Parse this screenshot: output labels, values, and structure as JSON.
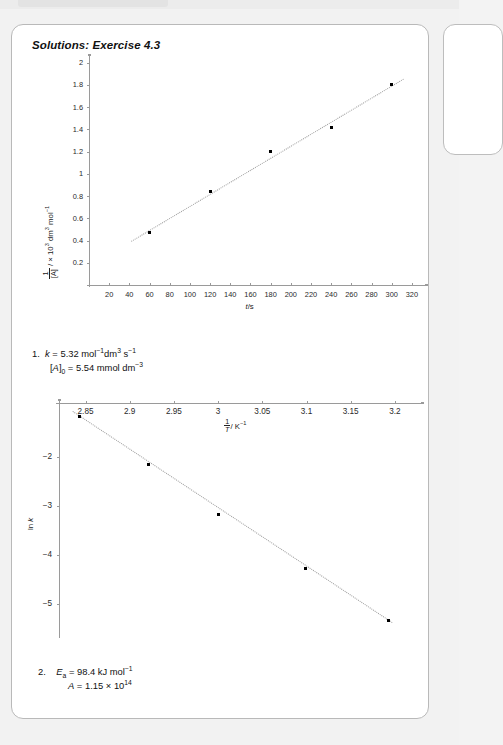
{
  "document": {
    "title": "Solutions: Exercise 4.3"
  },
  "chart_data": [
    {
      "type": "scatter",
      "id": "second-order-plot",
      "title": "",
      "xlabel": "t/s",
      "ylabel": "1/[A] / × 10³ dm³ mol⁻¹",
      "ylabel_parts": {
        "num": "1",
        "den": "[A]",
        "rest": " / × 10³ dm³ mol⁻¹"
      },
      "xlim": [
        0,
        330
      ],
      "ylim": [
        0,
        2.05
      ],
      "xticks": [
        20,
        40,
        60,
        80,
        100,
        120,
        140,
        160,
        180,
        200,
        220,
        240,
        260,
        280,
        300,
        320
      ],
      "yticks": [
        0.2,
        0.4,
        0.6,
        0.8,
        1,
        1.2,
        1.4,
        1.6,
        1.8,
        2
      ],
      "x": [
        60,
        120,
        180,
        240,
        300
      ],
      "y": [
        0.47,
        0.84,
        1.2,
        1.42,
        1.8
      ],
      "trendline": {
        "x0": 42,
        "y0": 0.4,
        "x1": 312,
        "y1": 1.86,
        "style": "dotted"
      },
      "grid": false,
      "legend": null
    },
    {
      "type": "scatter",
      "id": "arrhenius-plot",
      "title": "",
      "xlabel": "1/T / K⁻¹",
      "xlabel_parts": {
        "num": "1",
        "den": "T",
        "rest": "/ K⁻¹"
      },
      "ylabel": "ln k",
      "xlim": [
        2.82,
        3.225
      ],
      "ylim": [
        -5.6,
        -0.9
      ],
      "xticks": [
        2.85,
        2.9,
        2.95,
        3,
        3.05,
        3.1,
        3.15,
        3.2
      ],
      "xticklabels": [
        "2.85",
        "2.9",
        "2.95",
        "3",
        "3.05",
        "3.1",
        "3.15",
        "3.2"
      ],
      "yticks": [
        -2,
        -3,
        -4,
        -5
      ],
      "yticklabels": [
        "−2",
        "−3",
        "−4",
        "−5"
      ],
      "x": [
        2.843,
        2.921,
        3.001,
        3.099,
        3.193
      ],
      "y": [
        -1.18,
        -2.15,
        -3.17,
        -4.28,
        -5.35
      ],
      "trendline": {
        "x0": 2.836,
        "y0": -1.07,
        "x1": 3.197,
        "y1": -5.38,
        "style": "dotted"
      },
      "axis_position": "x-axis-top",
      "grid": false,
      "legend": null
    }
  ],
  "answers": [
    {
      "number": "1.",
      "lines": [
        {
          "symbol": "k",
          "body": " = 5.32 mol",
          "sup1": "−1",
          "body2": "dm",
          "sup2": "3",
          "body3": " s",
          "sup3": "−1"
        },
        {
          "symbol": "[A]",
          "sub": "0",
          "body": " = 5.54 mmol dm",
          "sup1": "−3"
        }
      ],
      "plain": [
        "k = 5.32 mol−1dm3 s−1",
        "[A]0 = 5.54 mmol dm−3"
      ]
    },
    {
      "number": "2.",
      "lines": [
        {
          "symbol": "E",
          "sub": "a",
          "body": " = 98.4 kJ mol",
          "sup1": "−1"
        },
        {
          "symbol": "A",
          "body": " = 1.15 × 10",
          "sup1": "14"
        }
      ],
      "plain": [
        "Ea = 98.4 kJ mol−1",
        "A = 1.15 × 1014"
      ]
    }
  ],
  "colors": {
    "page_background": "#f2f2f2",
    "card_background": "#ffffff",
    "card_border": "#b9b9b9",
    "axis": "#9a9a9a",
    "point": "#000000",
    "trendline": "#9c9c9c",
    "text": "#111111"
  }
}
